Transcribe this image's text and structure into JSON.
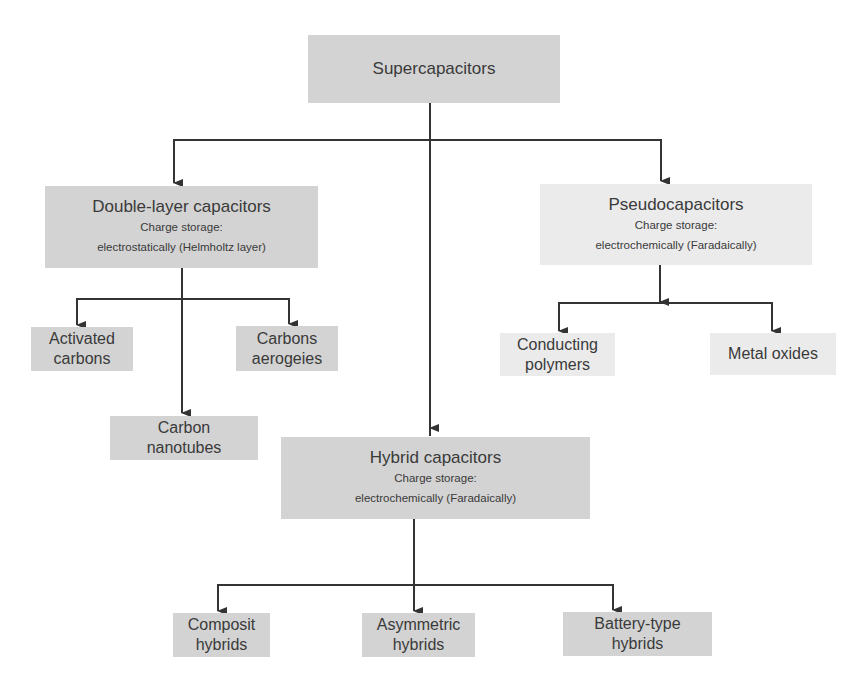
{
  "root": {
    "label": "Supercapacitors"
  },
  "branches": {
    "double_layer": {
      "title": "Double-layer capacitors",
      "storage_label": "Charge storage:",
      "storage_mode": "electrostatically (Helmholtz layer)",
      "children": [
        {
          "line1": "Activated",
          "line2": "carbons"
        },
        {
          "line1": "Carbons",
          "line2": "aerogeies"
        },
        {
          "line1": "Carbon",
          "line2": "nanotubes"
        }
      ]
    },
    "pseudo": {
      "title": "Pseudocapacitors",
      "storage_label": "Charge storage:",
      "storage_mode": "electrochemically (Faradaically)",
      "children": [
        {
          "line1": "Conducting",
          "line2": "polymers"
        },
        {
          "line1": "Metal oxides"
        }
      ]
    },
    "hybrid": {
      "title": "Hybrid capacitors",
      "storage_label": "Charge storage:",
      "storage_mode": "electrochemically (Faradaically)",
      "children": [
        {
          "line1": "Composit",
          "line2": "hybrids"
        },
        {
          "line1": "Asymmetric",
          "line2": "hybrids"
        },
        {
          "line1": "Battery-type",
          "line2": "hybrids"
        }
      ]
    }
  },
  "colors": {
    "box_dark": "#d3d3d3",
    "box_light": "#ebebeb",
    "line": "#333333",
    "text": "#3a3a3a"
  }
}
